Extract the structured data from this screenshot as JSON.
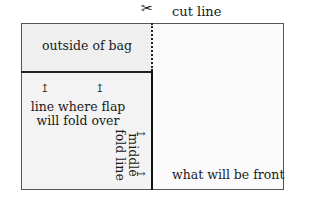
{
  "diagram": {
    "cut_line": {
      "icon": "scissors-icon",
      "label": "cut line"
    },
    "regions": {
      "outside": "outside of bag",
      "flap_line": "line where flap will fold over",
      "middle_fold": {
        "line1": "middle",
        "line2": "fold line"
      },
      "front": "what will be front"
    },
    "colors": {
      "border": "#555555",
      "fold_lines": "#111111",
      "panel_fill": "#efefef",
      "background": "#ffffff"
    }
  }
}
